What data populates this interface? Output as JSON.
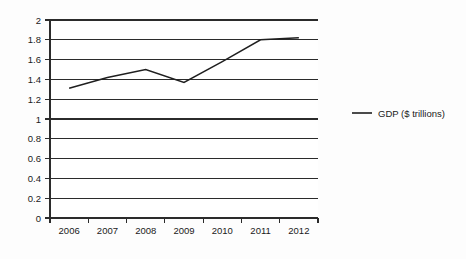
{
  "chart_data": {
    "type": "line",
    "title": "",
    "xlabel": "",
    "ylabel": "",
    "categories": [
      "2006",
      "2007",
      "2008",
      "2009",
      "2010",
      "2011",
      "2012"
    ],
    "series": [
      {
        "name": "GDP ($ trillions)",
        "values": [
          1.31,
          1.42,
          1.5,
          1.37,
          1.58,
          1.8,
          1.82
        ]
      }
    ],
    "ylim": [
      0,
      2
    ],
    "ytick_step": 0.2,
    "ytick_labels": [
      "0",
      "0.2",
      "0.4",
      "0.6",
      "0.8",
      "1",
      "1.2",
      "1.4",
      "1.6",
      "1.8",
      "2"
    ],
    "grid": "horizontal",
    "legend_position": "right",
    "line_color": "#1f1f1f"
  },
  "legend": {
    "entries": [
      {
        "label": "GDP ($ trillions)",
        "color": "#1f1f1f"
      }
    ]
  }
}
